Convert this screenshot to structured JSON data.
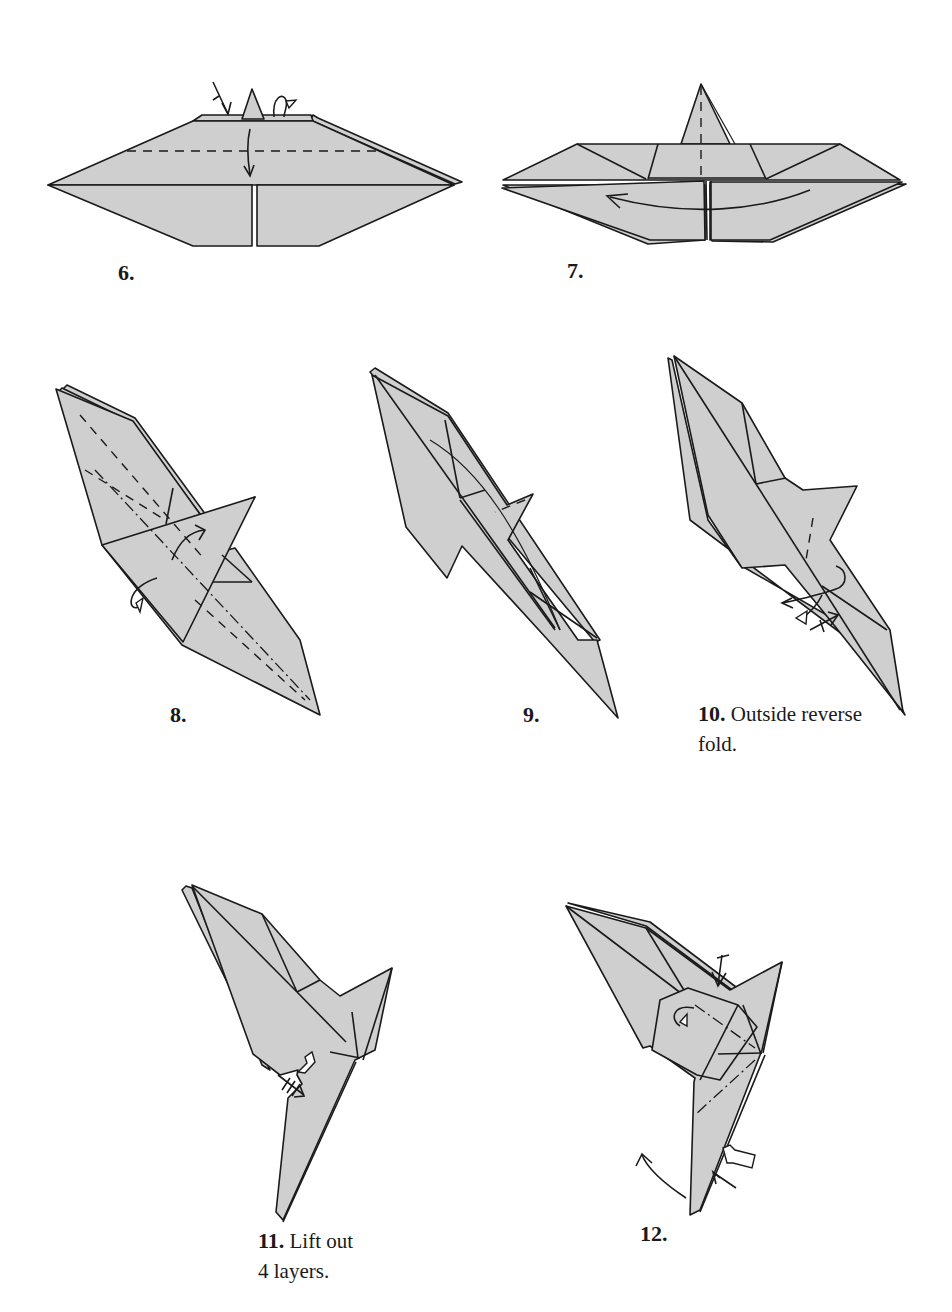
{
  "page": {
    "type": "origami instruction diagram page",
    "paper_color": "#cfcfcf",
    "line_color": "#1a1a1a"
  },
  "steps": [
    {
      "number": "6.",
      "text": "",
      "symbols": [
        "valley-fold-line",
        "fold-down-arrow",
        "mountain-fold-behind-arrow",
        "crease-arrow"
      ]
    },
    {
      "number": "7.",
      "text": "",
      "symbols": [
        "valley-fold-line",
        "curved-rotate-arrow"
      ]
    },
    {
      "number": "8.",
      "text": "",
      "symbols": [
        "valley-fold-lines",
        "mountain-fold-line",
        "fold-over-arrow",
        "fold-behind-arrow"
      ]
    },
    {
      "number": "9.",
      "text": "",
      "symbols": [
        "valley-fold-line"
      ]
    },
    {
      "number": "10.",
      "text": "Outside reverse",
      "text2": "fold.",
      "symbols": [
        "valley-fold-line",
        "reverse-fold-arrows",
        "crease-arrow"
      ]
    },
    {
      "number": "11.",
      "text": "Lift out",
      "text2": "4 layers.",
      "symbols": [
        "push-arrow",
        "crease-arrow-triple"
      ]
    },
    {
      "number": "12.",
      "text": "",
      "symbols": [
        "mountain-fold-lines",
        "fold-behind-arrow",
        "crease-arrow",
        "push-arrow",
        "curved-arrow"
      ]
    }
  ]
}
